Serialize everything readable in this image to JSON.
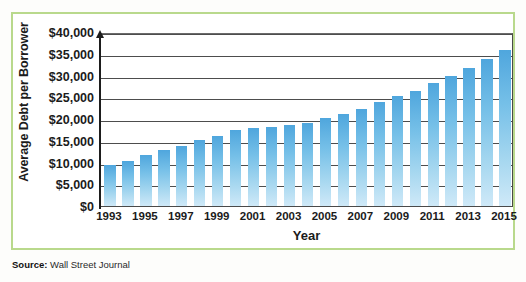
{
  "chart_data": {
    "type": "bar",
    "title": "",
    "xlabel": "Year",
    "ylabel": "Average Debt per Borrower",
    "ylim": [
      0,
      40000
    ],
    "ytick_step": 5000,
    "grid": true,
    "legend": "none",
    "bar_color": "#76c0e8",
    "categories": [
      "1993",
      "1994",
      "1995",
      "1996",
      "1997",
      "1998",
      "1999",
      "2000",
      "2001",
      "2002",
      "2003",
      "2004",
      "2005",
      "2006",
      "2007",
      "2008",
      "2009",
      "2010",
      "2011",
      "2012",
      "2013",
      "2014",
      "2015"
    ],
    "values": [
      9400,
      10400,
      11700,
      12900,
      13900,
      15100,
      16100,
      17500,
      17900,
      18200,
      18700,
      19100,
      20300,
      21100,
      22300,
      23800,
      25300,
      26500,
      28200,
      30000,
      31700,
      33700,
      35800
    ],
    "ytick_labels": [
      "$0",
      "$5,000",
      "$10,000",
      "$15,000",
      "$20,000",
      "$25,000",
      "$30,000",
      "$35,000",
      "$40,000"
    ],
    "ytick_values": [
      0,
      5000,
      10000,
      15000,
      20000,
      25000,
      30000,
      35000,
      40000
    ],
    "xtick_labels": [
      "1993",
      "1995",
      "1997",
      "1999",
      "2001",
      "2003",
      "2005",
      "2007",
      "2009",
      "2011",
      "2013",
      "2015"
    ],
    "xtick_categories": [
      "1993",
      "1995",
      "1997",
      "1999",
      "2001",
      "2003",
      "2005",
      "2007",
      "2009",
      "2011",
      "2013",
      "2015"
    ]
  },
  "source": {
    "label": "Source:",
    "text": "Wall Street Journal"
  },
  "frame": {
    "border_color": "#b9d98c"
  }
}
